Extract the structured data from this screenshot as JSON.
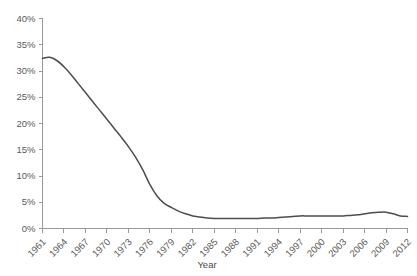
{
  "chart_data": {
    "type": "line",
    "title": "",
    "subtitle": "",
    "xlabel": "Year",
    "ylabel": "",
    "grid": false,
    "legend": false,
    "legend_position": "none",
    "line_color": "#4d4d4d",
    "axis_color": "#9a9a9a",
    "label_color": "#5a5a5a",
    "background": "#ffffff",
    "ylim": [
      0,
      40
    ],
    "y_ticks": [
      0,
      5,
      10,
      15,
      20,
      25,
      30,
      35,
      40
    ],
    "y_tick_labels": [
      "0%",
      "5%",
      "10%",
      "15%",
      "20%",
      "25%",
      "30%",
      "35%",
      "40%"
    ],
    "y_unit": "%",
    "xlim": [
      1961,
      2012
    ],
    "x_tick_labels": [
      "1961",
      "1964",
      "1967",
      "1970",
      "1973",
      "1976",
      "1979",
      "1982",
      "1985",
      "1988",
      "1991",
      "1994",
      "1997",
      "2000",
      "2003",
      "2006",
      "2009",
      "2012"
    ],
    "x_tick_step": 3,
    "x_label_rotation": -45,
    "x": [
      1961,
      1962,
      1963,
      1964,
      1965,
      1966,
      1967,
      1968,
      1969,
      1970,
      1971,
      1972,
      1973,
      1974,
      1975,
      1976,
      1977,
      1978,
      1979,
      1980,
      1981,
      1982,
      1983,
      1984,
      1985,
      1986,
      1987,
      1988,
      1989,
      1990,
      1991,
      1992,
      1993,
      1994,
      1995,
      1996,
      1997,
      1998,
      1999,
      2000,
      2001,
      2002,
      2003,
      2004,
      2005,
      2006,
      2007,
      2008,
      2009,
      2010,
      2011,
      2012
    ],
    "values": [
      32.4,
      32.6,
      32.0,
      30.8,
      29.3,
      27.6,
      25.9,
      24.2,
      22.5,
      20.8,
      19.1,
      17.4,
      15.6,
      13.6,
      11.2,
      8.4,
      6.2,
      4.8,
      4.0,
      3.3,
      2.8,
      2.4,
      2.2,
      2.0,
      1.9,
      1.9,
      1.9,
      1.9,
      1.9,
      1.9,
      1.9,
      2.0,
      2.0,
      2.1,
      2.2,
      2.3,
      2.4,
      2.4,
      2.4,
      2.4,
      2.4,
      2.4,
      2.4,
      2.5,
      2.6,
      2.8,
      3.0,
      3.1,
      3.1,
      2.8,
      2.4,
      2.3
    ],
    "series": [
      {
        "name": "series-1",
        "color": "#4d4d4d",
        "values": [
          32.4,
          32.6,
          32.0,
          30.8,
          29.3,
          27.6,
          25.9,
          24.2,
          22.5,
          20.8,
          19.1,
          17.4,
          15.6,
          13.6,
          11.2,
          8.4,
          6.2,
          4.8,
          4.0,
          3.3,
          2.8,
          2.4,
          2.2,
          2.0,
          1.9,
          1.9,
          1.9,
          1.9,
          1.9,
          1.9,
          1.9,
          2.0,
          2.0,
          2.1,
          2.2,
          2.3,
          2.4,
          2.4,
          2.4,
          2.4,
          2.4,
          2.4,
          2.4,
          2.5,
          2.6,
          2.8,
          3.0,
          3.1,
          3.1,
          2.8,
          2.4,
          2.3
        ]
      }
    ]
  }
}
